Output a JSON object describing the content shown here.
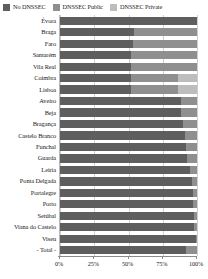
{
  "legend": {
    "position": "top-left",
    "items": [
      {
        "label": "No DNSSEC",
        "color": "#5e5e5e",
        "icon": "square-swatch-icon"
      },
      {
        "label": "DNSSEC Public",
        "color": "#8f8f8f",
        "icon": "square-swatch-icon"
      },
      {
        "label": "DNSSEC Private",
        "color": "#bdbdbd",
        "icon": "square-swatch-icon"
      }
    ]
  },
  "axis": {
    "x_ticks": [
      "0%",
      "25%",
      "50%",
      "75%",
      "100%"
    ],
    "x_tick_values": [
      0,
      25,
      50,
      75,
      100
    ]
  },
  "chart_data": {
    "type": "bar",
    "orientation": "horizontal",
    "stacked": true,
    "normalized": true,
    "title": "",
    "xlabel": "",
    "ylabel": "",
    "xlim": [
      0,
      100
    ],
    "grid": true,
    "legend_position": "top-left",
    "tick_labels": [
      "0%",
      "25%",
      "50%",
      "75%",
      "100%"
    ],
    "categories": [
      "Évora",
      "Braga",
      "Faro",
      "Santarém",
      "Vila Real",
      "Coimbra",
      "Lisboa",
      "Aveiro",
      "Beja",
      "Bragança",
      "Castelo Branco",
      "Funchal",
      "Guarda",
      "Leiria",
      "Ponta Delgada",
      "Portalegre",
      "Porto",
      "Setúbal",
      "Viana do Castelo",
      "Viseu",
      "- Total -"
    ],
    "series": [
      {
        "name": "No DNSSEC",
        "color": "#5e5e5e",
        "values": [
          100,
          54,
          53,
          52,
          52,
          52,
          52,
          88,
          88,
          90,
          91,
          92,
          93,
          95,
          96,
          97,
          97,
          98,
          98,
          99,
          92
        ]
      },
      {
        "name": "DNSSEC Public",
        "color": "#8f8f8f",
        "values": [
          0,
          46,
          47,
          48,
          48,
          34,
          34,
          12,
          12,
          10,
          9,
          8,
          7,
          5,
          4,
          3,
          3,
          2,
          2,
          1,
          8
        ]
      },
      {
        "name": "DNSSEC Private",
        "color": "#bdbdbd",
        "values": [
          0,
          0,
          0,
          0,
          0,
          14,
          14,
          0,
          0,
          0,
          0,
          0,
          0,
          0,
          0,
          0,
          0,
          0,
          0,
          0,
          0
        ]
      }
    ]
  }
}
